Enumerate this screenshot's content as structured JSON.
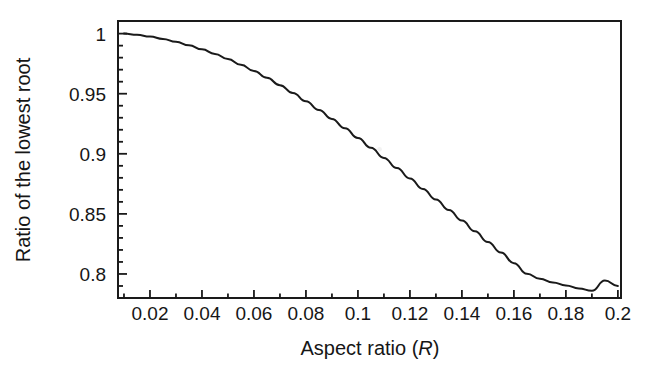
{
  "figure": {
    "background_color": "#ffffff",
    "line_color": "#1a1a1a",
    "axis_color": "#1a1a1a"
  },
  "chart_data": {
    "type": "line",
    "title": "",
    "subtitle": "",
    "xlabel": "Aspect ratio (R)",
    "xlabel_plain": "Aspect ratio",
    "xlabel_symbol": "R",
    "ylabel": "Ratio of the lowest root",
    "xlim": [
      0.0077,
      0.2012
    ],
    "ylim": [
      0.78,
      1.0105
    ],
    "xticks": [
      0.02,
      0.04,
      0.06,
      0.08,
      0.1,
      0.12,
      0.14,
      0.16,
      0.18,
      0.2
    ],
    "xticklabels": [
      "0.02",
      "0.04",
      "0.06",
      "0.08",
      "0.1",
      "0.12",
      "0.14",
      "0.16",
      "0.18",
      "0.2"
    ],
    "yticks": [
      0.8,
      0.85,
      0.9,
      0.95,
      1.0
    ],
    "yticklabels": [
      "0.8",
      "0.85",
      "0.9",
      "0.95",
      "1"
    ],
    "x_minor_tick_step": 0.01,
    "y_minor_tick_step": 0.01,
    "grid": false,
    "legend": false,
    "legend_position": "none",
    "frame": "box",
    "series": [
      {
        "name": "Ratio of the lowest root",
        "color": "#1a1a1a",
        "linewidth": 2,
        "x": [
          0.01,
          0.015,
          0.02,
          0.025,
          0.03,
          0.035,
          0.04,
          0.045,
          0.05,
          0.055,
          0.06,
          0.065,
          0.07,
          0.075,
          0.08,
          0.085,
          0.09,
          0.095,
          0.1,
          0.105,
          0.11,
          0.115,
          0.12,
          0.125,
          0.13,
          0.135,
          0.14,
          0.145,
          0.15,
          0.155,
          0.16,
          0.165,
          0.17,
          0.175,
          0.18,
          0.185,
          0.19,
          0.195,
          0.2
        ],
        "values": [
          1.0,
          0.999,
          0.9975,
          0.9956,
          0.9932,
          0.9903,
          0.9869,
          0.9831,
          0.9788,
          0.9741,
          0.9689,
          0.9632,
          0.9571,
          0.9506,
          0.9437,
          0.9365,
          0.929,
          0.9212,
          0.9132,
          0.905,
          0.8966,
          0.8881,
          0.8795,
          0.8708,
          0.862,
          0.8532,
          0.8444,
          0.8355,
          0.8266,
          0.8178,
          0.809,
          0.8002,
          0.796,
          0.793,
          0.7905,
          0.788,
          0.786,
          0.7945,
          0.79
        ]
      }
    ],
    "annotations": [
      {
        "name": "curve-gap-artifact",
        "x": 0.1083,
        "y": 0.9037,
        "note": "small white break in the plotted line"
      }
    ]
  }
}
